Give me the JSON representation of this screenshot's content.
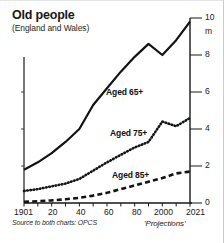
{
  "figure": {
    "title": "Old people",
    "subtitle": "(England and Wales)",
    "source": "Source to both charts: OPCS",
    "projections_note": "'Projections'"
  },
  "chart_data": {
    "type": "line",
    "title": "Old people",
    "subtitle": "(England and Wales)",
    "xlabel": "",
    "ylabel": "m",
    "unit_label": "m",
    "xlim": [
      1901,
      2021
    ],
    "ylim": [
      0,
      10
    ],
    "grid": false,
    "legend_position": "inline-annotations",
    "y_axis_side": "right",
    "x_ticks": [
      1901,
      1911,
      1921,
      1931,
      1941,
      1951,
      1961,
      1971,
      1981,
      1991,
      2001,
      2011,
      2021
    ],
    "x_tick_labels": [
      "1901",
      "",
      "20",
      "",
      "40",
      "",
      "60",
      "",
      "80",
      "",
      "2000",
      "",
      "2021"
    ],
    "y_ticks": [
      0,
      2,
      4,
      6,
      8,
      10
    ],
    "y_tick_labels": [
      "0",
      "2",
      "4",
      "6",
      "8",
      "10"
    ],
    "annotations": [
      "'Projections'",
      "Source to both charts: OPCS"
    ],
    "series": [
      {
        "name": "Aged 65+",
        "label": "Aged 65+",
        "style": "solid",
        "color": "#111315",
        "x": [
          1901,
          1911,
          1921,
          1931,
          1941,
          1951,
          1961,
          1971,
          1981,
          1991,
          2001,
          2011,
          2021
        ],
        "values": [
          1.8,
          2.2,
          2.7,
          3.3,
          4.0,
          5.3,
          6.2,
          7.1,
          7.9,
          8.6,
          8.0,
          8.8,
          9.8
        ]
      },
      {
        "name": "Aged 75+",
        "label": "Aged 75+",
        "style": "dotted",
        "color": "#111315",
        "x": [
          1901,
          1911,
          1921,
          1931,
          1941,
          1951,
          1961,
          1971,
          1981,
          1991,
          2001,
          2011,
          2021
        ],
        "values": [
          0.65,
          0.75,
          0.9,
          1.05,
          1.3,
          1.75,
          2.2,
          2.6,
          3.0,
          3.3,
          4.4,
          4.15,
          4.6
        ]
      },
      {
        "name": "Aged 85+",
        "label": "Aged 85+",
        "style": "dashed",
        "color": "#111315",
        "x": [
          1901,
          1911,
          1921,
          1931,
          1941,
          1951,
          1961,
          1971,
          1981,
          1991,
          2001,
          2011,
          2021
        ],
        "values": [
          0.06,
          0.1,
          0.14,
          0.2,
          0.28,
          0.4,
          0.55,
          0.75,
          0.95,
          1.15,
          1.35,
          1.6,
          1.7
        ]
      }
    ]
  },
  "y_axis": {
    "labels": [
      {
        "text": "10",
        "top": 13
      },
      {
        "text": "m",
        "top": 27
      },
      {
        "text": "8",
        "top": 50
      },
      {
        "text": "6",
        "top": 87
      },
      {
        "text": "4",
        "top": 124
      },
      {
        "text": "2",
        "top": 161
      },
      {
        "text": "0",
        "top": 198
      }
    ]
  },
  "x_axis": {
    "labels": [
      {
        "text": "1901",
        "left": 14
      },
      {
        "text": "20",
        "left": 48
      },
      {
        "text": "40",
        "left": 76
      },
      {
        "text": "60",
        "left": 104
      },
      {
        "text": "80",
        "left": 132
      },
      {
        "text": "2000",
        "left": 154
      },
      {
        "text": "2021",
        "left": 186
      }
    ]
  },
  "series_labels": [
    {
      "text": "Aged 65+",
      "left": 106,
      "top": 87
    },
    {
      "text": "Aged 75+",
      "left": 110,
      "top": 128
    },
    {
      "text": "Aged 85+",
      "left": 112,
      "top": 170
    }
  ]
}
